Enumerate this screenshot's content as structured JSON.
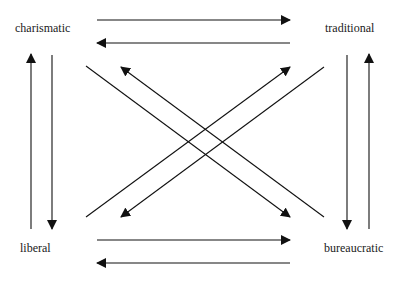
{
  "diagram": {
    "type": "relationship-diagram",
    "nodes": [
      {
        "id": "charismatic",
        "label": "charismatic",
        "x": 15,
        "y": 21
      },
      {
        "id": "traditional",
        "label": "traditional",
        "x": 325,
        "y": 21
      },
      {
        "id": "liberal",
        "label": "liberal",
        "x": 20,
        "y": 241
      },
      {
        "id": "bureaucratic",
        "label": "bureaucratic",
        "x": 324,
        "y": 241
      }
    ],
    "edges": [
      {
        "from": "charismatic",
        "to": "traditional"
      },
      {
        "from": "traditional",
        "to": "charismatic"
      },
      {
        "from": "liberal",
        "to": "bureaucratic"
      },
      {
        "from": "bureaucratic",
        "to": "liberal"
      },
      {
        "from": "liberal",
        "to": "charismatic"
      },
      {
        "from": "charismatic",
        "to": "liberal"
      },
      {
        "from": "traditional",
        "to": "bureaucratic"
      },
      {
        "from": "bureaucratic",
        "to": "traditional"
      },
      {
        "from": "charismatic",
        "to": "bureaucratic"
      },
      {
        "from": "bureaucratic",
        "to": "charismatic"
      },
      {
        "from": "liberal",
        "to": "traditional"
      },
      {
        "from": "traditional",
        "to": "liberal"
      }
    ],
    "colors": {
      "line": "#111111",
      "text": "#1a1a1a",
      "background": "#ffffff"
    }
  }
}
